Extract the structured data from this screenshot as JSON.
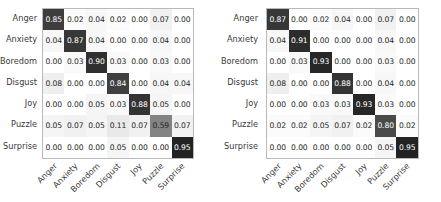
{
  "figure": {
    "background": "#ffffff",
    "text_color": "#3a3a3a",
    "grid_border_color": "#b9b9b9",
    "cell_text_light": "#ffffff",
    "cell_text_dark": "#262626"
  },
  "chart_data": [
    {
      "type": "heatmap",
      "title": "",
      "xlabel": "",
      "ylabel": "",
      "colormap": "greys",
      "vmin": 0,
      "vmax": 1,
      "grid": true,
      "legend": "none",
      "categories": [
        "Anger",
        "Anxiety",
        "Boredom",
        "Disgust",
        "Joy",
        "Puzzle",
        "Surprise"
      ],
      "x_tick_labels": [
        "Anger",
        "Anxiety",
        "Boredom",
        "Disgust",
        "Joy",
        "Puzzle",
        "Surprise"
      ],
      "y_tick_labels": [
        "Anger",
        "Anxiety",
        "Boredom",
        "Disgust",
        "Joy",
        "Puzzle",
        "Surprise"
      ],
      "x_tick_rotation": -45,
      "values": [
        [
          0.85,
          0.02,
          0.04,
          0.02,
          0.0,
          0.07,
          0.0
        ],
        [
          0.04,
          0.87,
          0.04,
          0.0,
          0.0,
          0.04,
          0.0
        ],
        [
          0.0,
          0.03,
          0.9,
          0.03,
          0.0,
          0.03,
          0.0
        ],
        [
          0.08,
          0.0,
          0.0,
          0.84,
          0.0,
          0.04,
          0.04
        ],
        [
          0.0,
          0.0,
          0.05,
          0.03,
          0.88,
          0.05,
          0.0
        ],
        [
          0.05,
          0.07,
          0.05,
          0.11,
          0.07,
          0.59,
          0.07
        ],
        [
          0.0,
          0.0,
          0.0,
          0.05,
          0.0,
          0.0,
          0.95
        ]
      ],
      "cell_labels": [
        [
          "0.85",
          "0.02",
          "0.04",
          "0.02",
          "0.00",
          "0.07",
          "0.00"
        ],
        [
          "0.04",
          "0.87",
          "0.04",
          "0.00",
          "0.00",
          "0.04",
          "0.00"
        ],
        [
          "0.00",
          "0.03",
          "0.90",
          "0.03",
          "0.00",
          "0.03",
          "0.00"
        ],
        [
          "0.08",
          "0.00",
          "0.00",
          "0.84",
          "0.00",
          "0.04",
          "0.04"
        ],
        [
          "0.00",
          "0.00",
          "0.05",
          "0.03",
          "0.88",
          "0.05",
          "0.00"
        ],
        [
          "0.05",
          "0.07",
          "0.05",
          "0.11",
          "0.07",
          "0.59",
          "0.07"
        ],
        [
          "0.00",
          "0.00",
          "0.00",
          "0.05",
          "0.00",
          "0.00",
          "0.95"
        ]
      ]
    },
    {
      "type": "heatmap",
      "title": "",
      "xlabel": "",
      "ylabel": "",
      "colormap": "greys",
      "vmin": 0,
      "vmax": 1,
      "grid": true,
      "legend": "none",
      "categories": [
        "Anger",
        "Anxiety",
        "Boredom",
        "Disgust",
        "Joy",
        "Puzzle",
        "Surprise"
      ],
      "x_tick_labels": [
        "Anger",
        "Anxiety",
        "Boredom",
        "Disgust",
        "Joy",
        "Puzzle",
        "Surprise"
      ],
      "y_tick_labels": [
        "Anger",
        "Anxiety",
        "Boredom",
        "Disgust",
        "Joy",
        "Puzzle",
        "Surprise"
      ],
      "x_tick_rotation": -45,
      "values": [
        [
          0.87,
          0.0,
          0.02,
          0.04,
          0.0,
          0.07,
          0.0
        ],
        [
          0.04,
          0.91,
          0.0,
          0.0,
          0.0,
          0.04,
          0.0
        ],
        [
          0.0,
          0.03,
          0.93,
          0.0,
          0.0,
          0.03,
          0.0
        ],
        [
          0.08,
          0.0,
          0.0,
          0.88,
          0.0,
          0.04,
          0.0
        ],
        [
          0.0,
          0.0,
          0.03,
          0.03,
          0.93,
          0.03,
          0.0
        ],
        [
          0.02,
          0.02,
          0.05,
          0.07,
          0.02,
          0.8,
          0.02
        ],
        [
          0.0,
          0.0,
          0.0,
          0.0,
          0.0,
          0.05,
          0.95
        ]
      ],
      "cell_labels": [
        [
          "0.87",
          "0.00",
          "0.02",
          "0.04",
          "0.00",
          "0.07",
          "0.00"
        ],
        [
          "0.04",
          "0.91",
          "0.00",
          "0.00",
          "0.00",
          "0.04",
          "0.00"
        ],
        [
          "0.00",
          "0.03",
          "0.93",
          "0.00",
          "0.00",
          "0.03",
          "0.00"
        ],
        [
          "0.08",
          "0.00",
          "0.00",
          "0.88",
          "0.00",
          "0.04",
          "0.00"
        ],
        [
          "0.00",
          "0.00",
          "0.03",
          "0.03",
          "0.93",
          "0.03",
          "0.00"
        ],
        [
          "0.02",
          "0.02",
          "0.05",
          "0.07",
          "0.02",
          "0.80",
          "0.02"
        ],
        [
          "0.00",
          "0.00",
          "0.00",
          "0.00",
          "0.00",
          "0.05",
          "0.95"
        ]
      ]
    }
  ]
}
